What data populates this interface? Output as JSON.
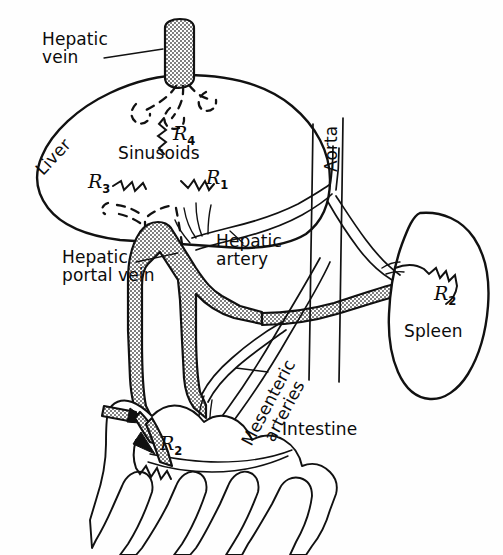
{
  "figure": {
    "background_color": "#fefefe",
    "line_color": "#111111",
    "vessel_fill": "stippled-gray"
  },
  "labels": {
    "hepatic_vein": "Hepatic\nvein",
    "liver": "Liver",
    "sinusoids": "Sinusoids",
    "hepatic_portal_vein": "Hepatic\nportal vein",
    "hepatic_artery": "Hepatic\nartery",
    "aorta": "Aorta",
    "spleen": "Spleen",
    "mesenteric_arteries": "Mesenteric\narteries",
    "intestine": "Intestine"
  },
  "resistors": [
    {
      "id": "r4",
      "name": "R",
      "subscript": "4",
      "location": "liver-sinusoid-outflow"
    },
    {
      "id": "r3",
      "name": "R",
      "subscript": "3",
      "location": "liver-sinusoid-left"
    },
    {
      "id": "r1",
      "name": "R",
      "subscript": "1",
      "location": "liver-sinusoid-right"
    },
    {
      "id": "r2_spleen",
      "name": "R",
      "subscript": "2",
      "location": "spleen"
    },
    {
      "id": "r2_intestine",
      "name": "R",
      "subscript": "2",
      "location": "intestine"
    }
  ],
  "organs": [
    {
      "id": "liver",
      "label": "Liver"
    },
    {
      "id": "spleen",
      "label": "Spleen"
    },
    {
      "id": "intestine",
      "label": "Intestine"
    }
  ],
  "vessels": [
    {
      "id": "hepatic-vein",
      "label": "Hepatic vein",
      "style": "stippled"
    },
    {
      "id": "hepatic-portal-vein",
      "label": "Hepatic portal vein",
      "style": "stippled"
    },
    {
      "id": "hepatic-artery",
      "label": "Hepatic artery",
      "style": "open"
    },
    {
      "id": "aorta",
      "label": "Aorta",
      "style": "open"
    },
    {
      "id": "mesenteric-arteries",
      "label": "Mesenteric arteries",
      "style": "open"
    },
    {
      "id": "splenic-vein",
      "label": "Splenic vein",
      "style": "stippled"
    }
  ]
}
